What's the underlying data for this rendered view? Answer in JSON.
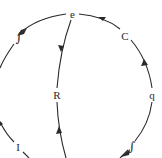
{
  "diagram": {
    "type": "circular-flow-diagram",
    "labels": {
      "top": "e",
      "upper_right": "C",
      "right": "q",
      "center": "R",
      "lower_left": "I",
      "integral_upper_left": "∫",
      "integral_lower_right": "∫"
    },
    "colors": {
      "line": "#2a2a2a",
      "background": "#ffffff"
    },
    "edges": [
      {
        "from": "e",
        "to": "upper-left-integral",
        "direction": "counterclockwise",
        "path": "top-left arc"
      },
      {
        "from": "C",
        "to": "e",
        "direction": "counterclockwise",
        "path": "top-right arc"
      },
      {
        "from": "q",
        "to": "C",
        "direction": "up",
        "path": "right arc"
      },
      {
        "from": "lower-right-integral",
        "to": "q",
        "direction": "up",
        "path": "lower-right arc"
      },
      {
        "from": "e",
        "to": "R",
        "direction": "down",
        "path": "chord"
      },
      {
        "from": "bottom",
        "to": "R",
        "direction": "up",
        "path": "chord"
      },
      {
        "from": "left",
        "to": "I",
        "direction": "down",
        "path": "lower-left arc"
      }
    ]
  }
}
